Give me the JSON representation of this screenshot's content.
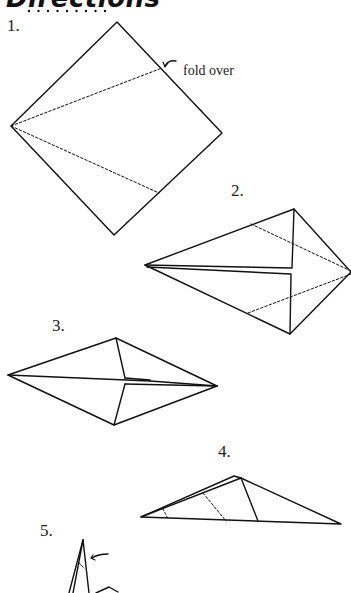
{
  "heading": {
    "text": "Directions"
  },
  "steps": [
    {
      "label": "1.",
      "annotation": "fold over"
    },
    {
      "label": "2."
    },
    {
      "label": "3."
    },
    {
      "label": "4."
    },
    {
      "label": "5."
    }
  ],
  "colors": {
    "line": "#111111",
    "background": "#ffffff"
  }
}
